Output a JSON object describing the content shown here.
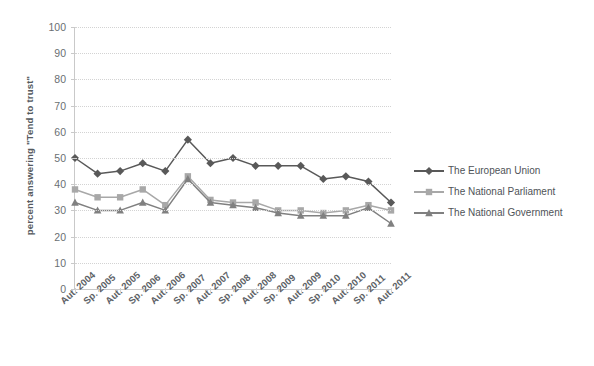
{
  "chart_data": {
    "type": "line",
    "title": "",
    "xlabel": "",
    "ylabel": "percent answering \"Tend to trust\"",
    "ylim": [
      0,
      100
    ],
    "ytick_step": 10,
    "yticks": [
      0,
      10,
      20,
      30,
      40,
      50,
      60,
      70,
      80,
      90,
      100
    ],
    "grid": true,
    "legend_position": "right",
    "categories": [
      "Aut. 2004",
      "Sp. 2005",
      "Aut. 2005",
      "Sp. 2006",
      "Aut. 2006",
      "Sp. 2007",
      "Aut. 2007",
      "Sp. 2008",
      "Aut. 2008",
      "Sp. 2009",
      "Aut. 2009",
      "Sp. 2010",
      "Aut. 2010",
      "Sp. 2011",
      "Aut. 2011"
    ],
    "series": [
      {
        "name": "The European Union",
        "color": "#595959",
        "marker": "diamond",
        "values": [
          50,
          44,
          45,
          48,
          45,
          57,
          48,
          50,
          47,
          47,
          47,
          42,
          43,
          41,
          33
        ]
      },
      {
        "name": "The National Parliament",
        "color": "#a8a8a8",
        "marker": "square",
        "values": [
          38,
          35,
          35,
          38,
          32,
          43,
          34,
          33,
          33,
          30,
          30,
          29,
          30,
          32,
          30
        ]
      },
      {
        "name": "The National Government",
        "color": "#808080",
        "marker": "triangle",
        "values": [
          33,
          30,
          30,
          33,
          30,
          42,
          33,
          32,
          31,
          29,
          28,
          28,
          28,
          31,
          25
        ]
      }
    ]
  },
  "legend": {
    "items": [
      {
        "label": "The European Union"
      },
      {
        "label": "The National Parliament"
      },
      {
        "label": "The National Government"
      }
    ]
  },
  "axis": {
    "y_title": "percent answering \"Tend to trust\""
  }
}
